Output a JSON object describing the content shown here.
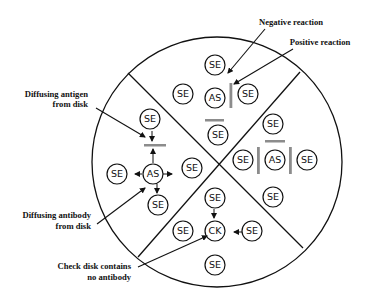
{
  "diagram": {
    "type": "gel-diffusion-plate",
    "disks": {
      "top": [
        {
          "id": "t1",
          "label": "SE"
        },
        {
          "id": "t2",
          "label": "SE"
        },
        {
          "id": "t3",
          "label": "AS"
        },
        {
          "id": "t4",
          "label": "SE"
        },
        {
          "id": "t5",
          "label": "SE"
        }
      ],
      "left": [
        {
          "id": "l1",
          "label": "SE"
        },
        {
          "id": "l2",
          "label": "AS"
        },
        {
          "id": "l3",
          "label": "SE"
        },
        {
          "id": "l4",
          "label": "SE"
        },
        {
          "id": "l5",
          "label": "SE"
        }
      ],
      "right": [
        {
          "id": "r1",
          "label": "SE"
        },
        {
          "id": "r2",
          "label": "AS"
        },
        {
          "id": "r3",
          "label": "SE"
        },
        {
          "id": "r4",
          "label": "SE"
        },
        {
          "id": "r5",
          "label": "SE"
        }
      ],
      "bottom": [
        {
          "id": "b1",
          "label": "SE"
        },
        {
          "id": "b2",
          "label": "CK"
        },
        {
          "id": "b3",
          "label": "SE"
        },
        {
          "id": "b4",
          "label": "SE"
        },
        {
          "id": "b5",
          "label": "SE"
        }
      ]
    },
    "annotations": {
      "negative_reaction": "Negative reaction",
      "positive_reaction": "Positive reaction",
      "diffusing_antigen_line1": "Diffusing antigen",
      "diffusing_antigen_line2": "from disk",
      "diffusing_antibody_line1": "Diffusing antibody",
      "diffusing_antibody_line2": "from disk",
      "check_disk_line1": "Check disk contains",
      "check_disk_line2": "no antibody"
    },
    "colors": {
      "outline": "#111111",
      "precipitin_band": "#8c8c8c",
      "background": "#ffffff"
    }
  }
}
